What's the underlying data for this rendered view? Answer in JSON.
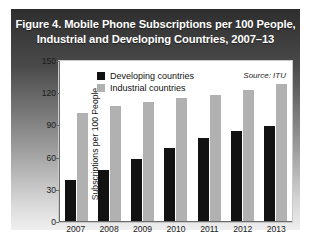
{
  "figure": {
    "title_line1": "Figure 4. Mobile Phone Subscriptions per 100 People,",
    "title_line2": "Industrial and Developing Countries, 2007–13",
    "source_note": "Source: ITU"
  },
  "legend": {
    "items": [
      {
        "label": "Developing countries",
        "color": "#121212",
        "key": "developing"
      },
      {
        "label": "Industrial countries",
        "color": "#b1b1b1",
        "key": "industrial"
      }
    ]
  },
  "chart_data": {
    "type": "bar",
    "title": "Figure 4. Mobile Phone Subscriptions per 100 People, Industrial and Developing Countries, 2007–13",
    "xlabel": "",
    "ylabel": "Subscriptions per 100 People",
    "categories": [
      "2007",
      "2008",
      "2009",
      "2010",
      "2011",
      "2012",
      "2013"
    ],
    "series": [
      {
        "name": "Developing countries",
        "color": "#121212",
        "values": [
          38,
          48,
          58,
          68,
          78,
          84,
          89
        ]
      },
      {
        "name": "Industrial countries",
        "color": "#b1b1b1",
        "values": [
          101,
          108,
          112,
          115,
          118,
          123,
          128
        ]
      }
    ],
    "ylim": [
      0,
      150
    ],
    "yticks": [
      0,
      30,
      60,
      90,
      120,
      150
    ],
    "ytick_labels": [
      "0",
      "30",
      "60",
      "90",
      "120",
      "150"
    ],
    "grid": false,
    "legend_position": "top-left-inside",
    "annotations": [
      "Source: ITU"
    ]
  }
}
